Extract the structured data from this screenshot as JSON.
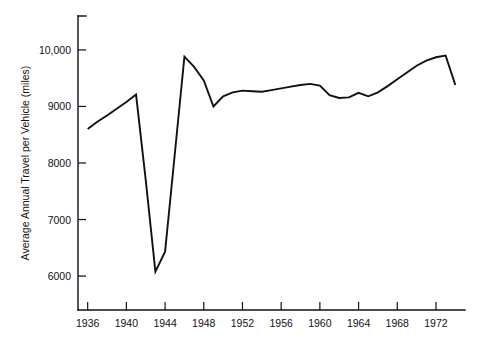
{
  "chart_data": {
    "type": "line",
    "title": "",
    "subtitle": "",
    "xlabel": "",
    "ylabel": "Average Annual Travel per Vehicle (miles)",
    "xlim": [
      1935,
      1975
    ],
    "ylim": [
      5400,
      10600
    ],
    "grid": false,
    "legend": null,
    "legend_position": "none",
    "line_color": "#111111",
    "background_color": "#ffffff",
    "x_tick_labels": [
      "1936",
      "1940",
      "1944",
      "1948",
      "1952",
      "1956",
      "1960",
      "1964",
      "1968",
      "1972"
    ],
    "x_tick_values": [
      1936,
      1940,
      1944,
      1948,
      1952,
      1956,
      1960,
      1964,
      1968,
      1972
    ],
    "y_tick_labels": [
      "6000",
      "7000",
      "8000",
      "9000",
      "10,000"
    ],
    "y_tick_values": [
      6000,
      7000,
      8000,
      9000,
      10000
    ],
    "x": [
      1936,
      1937,
      1938,
      1939,
      1940,
      1941,
      1942,
      1943,
      1944,
      1945,
      1946,
      1947,
      1948,
      1949,
      1950,
      1951,
      1952,
      1953,
      1954,
      1955,
      1956,
      1957,
      1958,
      1959,
      1960,
      1961,
      1962,
      1963,
      1964,
      1965,
      1966,
      1967,
      1968,
      1969,
      1970,
      1971,
      1972,
      1973,
      1974
    ],
    "values": [
      8600,
      8730,
      8840,
      8960,
      9080,
      9210,
      7700,
      6080,
      6430,
      8150,
      9880,
      9700,
      9460,
      9000,
      9180,
      9250,
      9280,
      9270,
      9260,
      9290,
      9320,
      9350,
      9380,
      9400,
      9370,
      9200,
      9150,
      9160,
      9240,
      9180,
      9250,
      9360,
      9480,
      9600,
      9720,
      9810,
      9870,
      9900,
      9380
    ],
    "series": [
      {
        "name": "Average annual travel per vehicle",
        "values": [
          8600,
          8730,
          8840,
          8960,
          9080,
          9210,
          7700,
          6080,
          6430,
          8150,
          9880,
          9700,
          9460,
          9000,
          9180,
          9250,
          9280,
          9270,
          9260,
          9290,
          9320,
          9350,
          9380,
          9400,
          9370,
          9200,
          9150,
          9160,
          9240,
          9180,
          9250,
          9360,
          9480,
          9600,
          9720,
          9810,
          9870,
          9900,
          9380
        ]
      }
    ],
    "annotations": []
  }
}
